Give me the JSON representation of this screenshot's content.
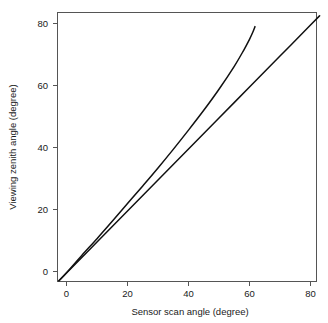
{
  "chart_data": {
    "type": "line",
    "title": "",
    "xlabel": "Sensor scan angle (degree)",
    "ylabel": "Viewing zenith angle (degree)",
    "xlim": [
      -4,
      84
    ],
    "ylim": [
      -3,
      84
    ],
    "xticks": [
      0,
      20,
      40,
      60,
      80
    ],
    "yticks": [
      0,
      20,
      40,
      60,
      80
    ],
    "xtick_labels": [
      "0",
      "20",
      "40",
      "60",
      "80"
    ],
    "ytick_labels": [
      "0",
      "20",
      "40",
      "60",
      "80"
    ],
    "grid": false,
    "legend": "none",
    "frame": "full-box",
    "line_color": "#111111",
    "axis_color": "#555555",
    "background": "#ffffff",
    "series": [
      {
        "name": "one-to-one line",
        "description": "straight 1:1 reference line from origin to upper right corner",
        "x": [
          -2.5,
          0,
          10,
          20,
          30,
          40,
          50,
          60,
          70,
          80,
          83
        ],
        "values": [
          -3.0,
          -0.5,
          9.5,
          19.5,
          29.5,
          39.5,
          49.5,
          59.5,
          69.5,
          79.5,
          82.5
        ]
      },
      {
        "name": "viewing zenith angle curve",
        "description": "curved relation of viewing zenith angle versus sensor scan angle, bending upward and terminating near 62 degrees scan angle",
        "x": [
          -2.5,
          0,
          5,
          10,
          15,
          20,
          25,
          30,
          35,
          40,
          45,
          50,
          55,
          58,
          60,
          61,
          61.8
        ],
        "values": [
          -3.0,
          -0.4,
          5.2,
          10.6,
          16.2,
          21.9,
          27.6,
          33.4,
          39.4,
          45.6,
          52.0,
          58.8,
          66.2,
          71.2,
          74.9,
          77.0,
          79.0
        ]
      }
    ]
  }
}
